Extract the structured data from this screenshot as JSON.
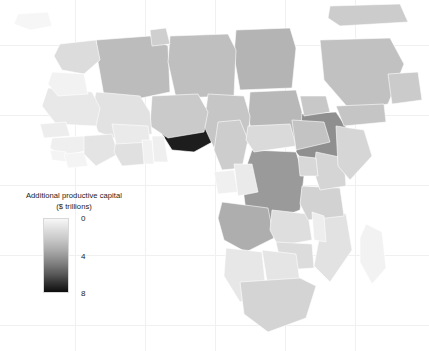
{
  "figure": {
    "background_color": "#ffffff",
    "type": "choropleth-map",
    "region": "Africa"
  },
  "legend": {
    "title_line1": "Additional productive capital",
    "title_line2": "($ trillions)",
    "ticks": [
      {
        "label": "0",
        "value": 0,
        "pos_pct": 0
      },
      {
        "label": "4",
        "value": 4,
        "pos_pct": 50
      },
      {
        "label": "8",
        "value": 8,
        "pos_pct": 100
      }
    ],
    "colors": {
      "low": "#f7f7f7",
      "mid": "#828282",
      "high": "#0d0d0d"
    },
    "orientation": "vertical",
    "bar_width_px": 26,
    "bar_height_px": 75
  },
  "chart_data": {
    "type": "heatmap",
    "title": "Additional productive capital ($ trillions)",
    "xlabel": "",
    "ylabel": "",
    "legend_position": "left",
    "grid": true,
    "value_range": [
      0,
      8
    ],
    "colorscale": [
      "#f7f7f7",
      "#0d0d0d"
    ],
    "regions": [
      {
        "name": "Nigeria",
        "value": 8.0,
        "fill": "#1d1d1d"
      },
      {
        "name": "Ethiopia",
        "value": 4.6,
        "fill": "#8f8f8f"
      },
      {
        "name": "Democratic Republic of the Congo",
        "value": 4.2,
        "fill": "#9a9a9a"
      },
      {
        "name": "Egypt",
        "value": 3.2,
        "fill": "#b4b4b4"
      },
      {
        "name": "Algeria",
        "value": 3.0,
        "fill": "#bcbcbc"
      },
      {
        "name": "Libya",
        "value": 2.9,
        "fill": "#bfbfbf"
      },
      {
        "name": "Sudan",
        "value": 3.1,
        "fill": "#b8b8b8"
      },
      {
        "name": "Chad",
        "value": 2.6,
        "fill": "#c6c6c6"
      },
      {
        "name": "Niger",
        "value": 2.4,
        "fill": "#cacaca"
      },
      {
        "name": "Mali",
        "value": 1.2,
        "fill": "#e2e2e2"
      },
      {
        "name": "Mauritania",
        "value": 1.0,
        "fill": "#e8e8e8"
      },
      {
        "name": "Morocco",
        "value": 1.6,
        "fill": "#dcdcdc"
      },
      {
        "name": "Western Sahara",
        "value": 0.4,
        "fill": "#f2f2f2"
      },
      {
        "name": "Tunisia",
        "value": 2.2,
        "fill": "#cfcfcf"
      },
      {
        "name": "Senegal",
        "value": 0.7,
        "fill": "#ededed"
      },
      {
        "name": "Guinea",
        "value": 0.6,
        "fill": "#efefef"
      },
      {
        "name": "Sierra Leone",
        "value": 0.3,
        "fill": "#f4f4f4"
      },
      {
        "name": "Liberia",
        "value": 0.3,
        "fill": "#f4f4f4"
      },
      {
        "name": "Ivory Coast",
        "value": 1.1,
        "fill": "#e4e4e4"
      },
      {
        "name": "Ghana",
        "value": 1.3,
        "fill": "#e0e0e0"
      },
      {
        "name": "Burkina Faso",
        "value": 0.9,
        "fill": "#eaeaea"
      },
      {
        "name": "Togo",
        "value": 0.4,
        "fill": "#f1f1f1"
      },
      {
        "name": "Benin",
        "value": 0.5,
        "fill": "#efefef"
      },
      {
        "name": "Cameroon",
        "value": 2.3,
        "fill": "#cdcdcd"
      },
      {
        "name": "Central African Republic",
        "value": 1.7,
        "fill": "#dadada"
      },
      {
        "name": "Gabon",
        "value": 0.5,
        "fill": "#f0f0f0"
      },
      {
        "name": "Republic of the Congo",
        "value": 0.9,
        "fill": "#eaeaea"
      },
      {
        "name": "Angola",
        "value": 3.4,
        "fill": "#aeaeae"
      },
      {
        "name": "Zambia",
        "value": 1.4,
        "fill": "#dedede"
      },
      {
        "name": "Zimbabwe",
        "value": 1.5,
        "fill": "#dcdcdc"
      },
      {
        "name": "Namibia",
        "value": 1.0,
        "fill": "#e7e7e7"
      },
      {
        "name": "Botswana",
        "value": 1.1,
        "fill": "#e5e5e5"
      },
      {
        "name": "South Africa",
        "value": 2.0,
        "fill": "#d4d4d4"
      },
      {
        "name": "Mozambique",
        "value": 1.2,
        "fill": "#e2e2e2"
      },
      {
        "name": "Tanzania",
        "value": 2.1,
        "fill": "#d2d2d2"
      },
      {
        "name": "Kenya",
        "value": 2.0,
        "fill": "#d5d5d5"
      },
      {
        "name": "Uganda",
        "value": 1.8,
        "fill": "#d8d8d8"
      },
      {
        "name": "Somalia",
        "value": 1.9,
        "fill": "#d6d6d6"
      },
      {
        "name": "Eritrea",
        "value": 2.5,
        "fill": "#c8c8c8"
      },
      {
        "name": "South Sudan",
        "value": 2.7,
        "fill": "#c3c3c3"
      },
      {
        "name": "Madagascar",
        "value": 0.4,
        "fill": "#f2f2f2"
      },
      {
        "name": "Malawi",
        "value": 0.6,
        "fill": "#eeeeee"
      },
      {
        "name": "Saudi Arabia",
        "value": 2.8,
        "fill": "#c1c1c1"
      },
      {
        "name": "Yemen",
        "value": 2.6,
        "fill": "#c5c5c5"
      },
      {
        "name": "Oman",
        "value": 2.4,
        "fill": "#cbcbcb"
      },
      {
        "name": "Spain",
        "value": 0.2,
        "fill": "#f6f6f6"
      },
      {
        "name": "Turkey",
        "value": 2.3,
        "fill": "#cccccc"
      }
    ]
  },
  "graticule": {
    "vertical_px": [
      75,
      145,
      215,
      285,
      355
    ],
    "horizontal_px": [
      45,
      115,
      185,
      255,
      325
    ]
  }
}
